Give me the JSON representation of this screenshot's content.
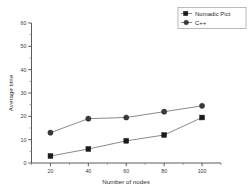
{
  "chart_data": {
    "type": "line",
    "title": "",
    "xlabel": "Number of nodes",
    "ylabel": "Average time",
    "x": [
      20,
      40,
      60,
      80,
      100
    ],
    "xticks": [
      "20",
      "40",
      "60",
      "80",
      "100"
    ],
    "yticks": [
      "0",
      "10",
      "20",
      "30",
      "40",
      "50",
      "60"
    ],
    "xlim": [
      10,
      110
    ],
    "ylim": [
      0,
      60
    ],
    "grid": false,
    "legend_position": "top-right",
    "series": [
      {
        "name": "Nomadic Pict",
        "marker": "square",
        "color": "#1a1a1a",
        "values": [
          3,
          6,
          9.5,
          12,
          19.5
        ]
      },
      {
        "name": "C++",
        "marker": "circle",
        "color": "#3a3a3a",
        "values": [
          13,
          19,
          19.5,
          22,
          24.5
        ]
      }
    ]
  },
  "legend": {
    "entries": [
      {
        "label": "Nomadic Pict"
      },
      {
        "label": "C++"
      }
    ]
  },
  "axes": {
    "x_title": "Number of nodes",
    "y_title": "Average time"
  }
}
